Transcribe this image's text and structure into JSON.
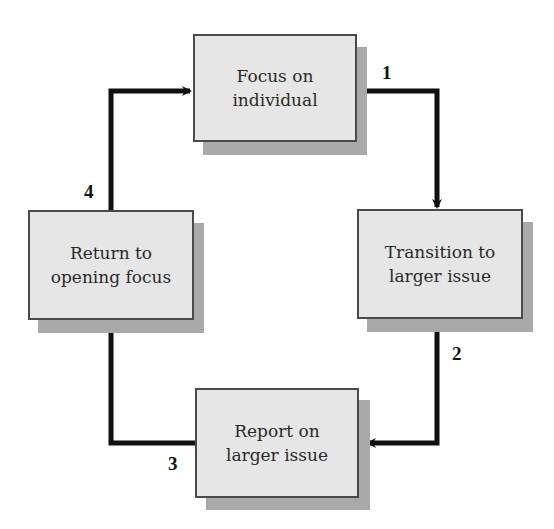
{
  "diagram": {
    "type": "cycle",
    "steps": [
      {
        "id": "focus",
        "line1": "Focus on",
        "line2": "individual"
      },
      {
        "id": "transition",
        "line1": "Transition to",
        "line2": "larger issue"
      },
      {
        "id": "report",
        "line1": "Report on",
        "line2": "larger issue"
      },
      {
        "id": "return",
        "line1": "Return to",
        "line2": "opening focus"
      }
    ],
    "arrows": [
      {
        "label": "1",
        "from": "focus",
        "to": "transition"
      },
      {
        "label": "2",
        "from": "transition",
        "to": "report"
      },
      {
        "label": "3",
        "from": "report",
        "to": "return"
      },
      {
        "label": "4",
        "from": "return",
        "to": "focus"
      }
    ],
    "colors": {
      "box_fill": "#e6e6e6",
      "box_border": "#4a4a4a",
      "shadow": "#a9a9a9",
      "arrow": "#111111"
    }
  }
}
